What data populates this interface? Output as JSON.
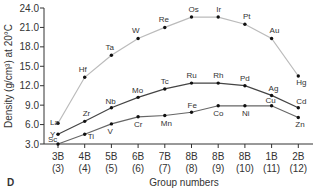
{
  "panel_label": "D",
  "chart_data": {
    "type": "line",
    "title": "",
    "xlabel": "Group numbers",
    "ylabel": "Density (g/cm³) at 20°C",
    "ylim": [
      3.0,
      24.0
    ],
    "yticks": [
      "3.0",
      "6.0",
      "9.0",
      "12.0",
      "15.0",
      "18.0",
      "21.0",
      "24.0"
    ],
    "categories": [
      "3B (3)",
      "4B (4)",
      "5B (5)",
      "6B (6)",
      "7B (7)",
      "8B (8)",
      "8B (9)",
      "8B (10)",
      "1B (11)",
      "2B (12)"
    ],
    "category_top": [
      "3B",
      "4B",
      "5B",
      "6B",
      "7B",
      "8B",
      "8B",
      "8B",
      "1B",
      "2B"
    ],
    "category_bottom": [
      "(3)",
      "(4)",
      "(5)",
      "(6)",
      "(7)",
      "(8)",
      "(9)",
      "(10)",
      "(11)",
      "(12)"
    ],
    "grid": false,
    "series": [
      {
        "name": "Period 6",
        "color": "#bbbbbb",
        "labels": [
          "La",
          "Hf",
          "Ta",
          "W",
          "Re",
          "Os",
          "Ir",
          "Pt",
          "Au",
          "Hg"
        ],
        "values": [
          6.2,
          13.3,
          16.7,
          19.3,
          21.0,
          22.6,
          22.6,
          21.5,
          19.3,
          13.5
        ]
      },
      {
        "name": "Period 5",
        "color": "#444444",
        "labels": [
          "Y",
          "Zr",
          "Nb",
          "Mo",
          "Tc",
          "Ru",
          "Rh",
          "Pd",
          "Ag",
          "Cd"
        ],
        "values": [
          4.5,
          6.5,
          8.6,
          10.2,
          11.5,
          12.4,
          12.4,
          12.0,
          10.5,
          8.6
        ]
      },
      {
        "name": "Period 4",
        "color": "#666666",
        "labels": [
          "Sc",
          "Ti",
          "V",
          "Cr",
          "Mn",
          "Fe",
          "Co",
          "Ni",
          "Cu",
          "Zn"
        ],
        "values": [
          3.0,
          4.5,
          6.1,
          7.2,
          7.4,
          7.9,
          8.9,
          8.9,
          8.9,
          7.1
        ]
      }
    ]
  }
}
